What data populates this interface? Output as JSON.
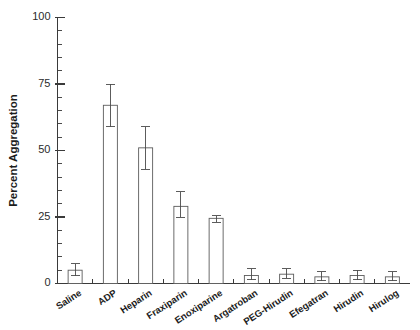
{
  "chart_data": {
    "type": "bar",
    "title": "",
    "subtitle": "",
    "xlabel": "",
    "ylabel": "Percent Aggregation",
    "ylim": [
      0,
      100
    ],
    "ytick_values": [
      0,
      25,
      50,
      75,
      100
    ],
    "ytick_labels": [
      "0",
      "25",
      "50",
      "75",
      "100"
    ],
    "yminor_step": 5,
    "grid": false,
    "legend": null,
    "legend_position": "none",
    "error_bar_style": "upper-and-lower-whisker-with-caps",
    "categories": [
      "Saline",
      "ADP",
      "Heparin",
      "Fraxiparin",
      "Enoxiparine",
      "Argatroban",
      "PEG-Hirudin",
      "Efegatran",
      "Hirudin",
      "Hirulog"
    ],
    "values": [
      5.0,
      67.0,
      51.0,
      29.0,
      24.5,
      3.0,
      3.5,
      2.5,
      3.0,
      2.5
    ],
    "err_upper": [
      7.5,
      75.0,
      59.0,
      34.5,
      25.5,
      5.5,
      5.5,
      4.5,
      5.0,
      4.5
    ],
    "err_lower": [
      3.0,
      59.0,
      43.0,
      25.0,
      23.0,
      1.5,
      2.0,
      1.0,
      1.5,
      1.0
    ],
    "bar_fill": "#ffffff",
    "bar_stroke": "#5c5c5c",
    "axis_color": "#3a3a3a"
  }
}
